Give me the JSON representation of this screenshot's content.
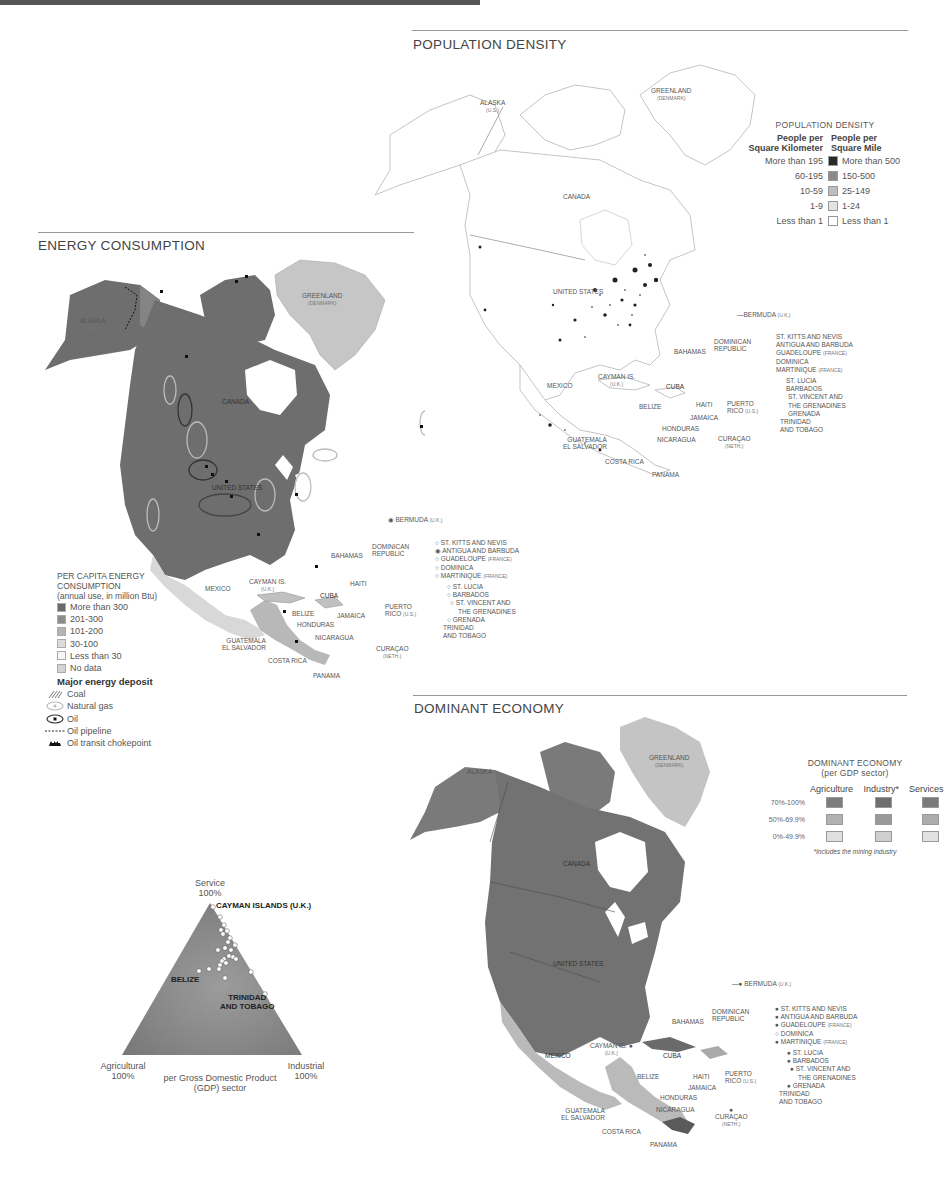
{
  "colors": {
    "land_dark": "#6e6e6e",
    "land_medium": "#8f8f8f",
    "land_light": "#c9c9c9",
    "land_pale": "#e4e4e4",
    "greenland": "#c4c4c4",
    "outline": "#b0b0b0"
  },
  "population_density": {
    "title": "POPULATION DENSITY",
    "legend": {
      "title": "POPULATION DENSITY",
      "col_left": "People per Square Kilometer",
      "col_left_1": "People per",
      "col_left_2": "Square Kilometer",
      "col_right_1": "People per",
      "col_right_2": "Square Mile",
      "rows": [
        {
          "km": "More than 195",
          "mi": "More than 500",
          "color": "#2a2a2a"
        },
        {
          "km": "60-195",
          "mi": "150-500",
          "color": "#8a8a8a"
        },
        {
          "km": "10-59",
          "mi": "25-149",
          "color": "#bdbdbd"
        },
        {
          "km": "1-9",
          "mi": "1-24",
          "color": "#e2e2e2"
        },
        {
          "km": "Less than 1",
          "mi": "Less than 1",
          "color": "#ffffff"
        }
      ]
    },
    "labels": {
      "alaska": "ALASKA",
      "alaska_sub": "(U.S.)",
      "greenland": "GREENLAND",
      "greenland_sub": "(DENMARK)",
      "canada": "CANADA",
      "us": "UNITED STATES",
      "mexico": "MEXICO",
      "bermuda": "BERMUDA",
      "bermuda_sub": "(U.K.)",
      "bahamas": "BAHAMAS",
      "dominican": "DOMINICAN",
      "dominican2": "REPUBLIC",
      "cayman": "CAYMAN IS.",
      "cayman_sub": "(U.K.)",
      "cuba": "CUBA",
      "belize": "BELIZE",
      "haiti": "HAITI",
      "jamaica": "JAMAICA",
      "puerto": "PUERTO",
      "puerto2": "RICO",
      "puerto_sub": "(U.S.)",
      "honduras": "HONDURAS",
      "guatemala": "GUATEMALA",
      "el_salvador": "EL SALVADOR",
      "nicaragua": "NICARAGUA",
      "costa_rica": "COSTA RICA",
      "panama": "PANAMA",
      "curacao": "CURAÇAO",
      "curacao_sub": "(NETH.)",
      "st_kitts": "ST. KITTS AND NEVIS",
      "antigua": "ANTIGUA AND BARBUDA",
      "guadeloupe": "GUADELOUPE",
      "guadeloupe_sub": "(FRANCE)",
      "dominica": "DOMINICA",
      "martinique": "MARTINIQUE",
      "martinique_sub": "(FRANCE)",
      "st_lucia": "ST. LUCIA",
      "barbados": "BARBADOS",
      "st_vincent": "ST. VINCENT AND",
      "st_vincent2": "THE GRENADINES",
      "grenada": "GRENADA",
      "trinidad": "TRINIDAD",
      "trinidad2": "AND TOBAGO"
    }
  },
  "energy_consumption": {
    "title": "ENERGY CONSUMPTION",
    "legend": {
      "title_1": "PER CAPITA ENERGY",
      "title_2": "CONSUMPTION",
      "subtitle": "(annual use, in million Btu)",
      "rows": [
        {
          "label": "More than 300",
          "color": "#6a6a6a"
        },
        {
          "label": "201-300",
          "color": "#8c8c8c"
        },
        {
          "label": "101-200",
          "color": "#b4b4b4"
        },
        {
          "label": "30-100",
          "color": "#dcdcdc"
        },
        {
          "label": "Less than 30",
          "color": "#f6f6f6"
        },
        {
          "label": "No data",
          "color": "#d4d4d4"
        }
      ],
      "deposit_title": "Major energy deposit",
      "deposits": [
        {
          "label": "Coal",
          "icon": "coal-hatch-icon"
        },
        {
          "label": "Natural gas",
          "icon": "natural-gas-icon"
        },
        {
          "label": "Oil",
          "icon": "oil-icon"
        },
        {
          "label": "Oil pipeline",
          "icon": "pipeline-icon"
        },
        {
          "label": "Oil transit chokepoint",
          "icon": "chokepoint-icon"
        }
      ]
    }
  },
  "dominant_economy": {
    "title": "DOMINANT ECONOMY",
    "legend": {
      "title_1": "DOMINANT ECONOMY",
      "title_2": "(per GDP sector)",
      "columns": [
        "Agriculture",
        "Industry*",
        "Services"
      ],
      "rows": [
        {
          "label": "70%-100%",
          "colors": [
            "#7d7d7d",
            "#6f6f6f",
            "#7a7a7a"
          ]
        },
        {
          "label": "50%-69.9%",
          "colors": [
            "#b2b2b2",
            "#9a9a9a",
            "#adadad"
          ]
        },
        {
          "label": "0%-49.9%",
          "colors": [
            "#e0e0e0",
            "#cfcfcf",
            "#e2e2e2"
          ]
        }
      ],
      "footnote": "*Includes the mining industry"
    }
  },
  "ternary": {
    "apex_top": "Service",
    "apex_top_pct": "100%",
    "apex_left": "Agricultural",
    "apex_left_pct": "100%",
    "apex_right": "Industrial",
    "apex_right_pct": "100%",
    "caption_1": "per Gross Domestic Product",
    "caption_2": "(GDP) sector",
    "callouts": {
      "cayman": "CAYMAN ISLANDS (U.K.)",
      "belize": "BELIZE",
      "trinidad_1": "TRINIDAD",
      "trinidad_2": "AND TOBAGO"
    },
    "points": [
      [
        133,
        37
      ],
      [
        140,
        47
      ],
      [
        144,
        55
      ],
      [
        141,
        60
      ],
      [
        147,
        61
      ],
      [
        143,
        64
      ],
      [
        150,
        68
      ],
      [
        148,
        72
      ],
      [
        155,
        75
      ],
      [
        145,
        78
      ],
      [
        151,
        80
      ],
      [
        138,
        80
      ],
      [
        149,
        86
      ],
      [
        153,
        87
      ],
      [
        156,
        89
      ],
      [
        144,
        89
      ],
      [
        142,
        91
      ],
      [
        146,
        93
      ],
      [
        140,
        95
      ],
      [
        129,
        99
      ],
      [
        139,
        99
      ],
      [
        119,
        101
      ],
      [
        171,
        102
      ],
      [
        145,
        108
      ],
      [
        185,
        124
      ]
    ]
  }
}
